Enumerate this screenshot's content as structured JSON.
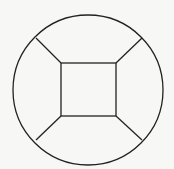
{
  "diagram": {
    "background": "#f7f7f5",
    "stroke": "#222222",
    "stroke_width": 1.3,
    "circle": {
      "cx": 88,
      "cy": 90,
      "r": 75
    },
    "square": {
      "x": 61,
      "y": 63,
      "w": 55,
      "h": 53
    },
    "connectors": [
      {
        "x1": 61,
        "y1": 63,
        "x2": 36,
        "y2": 38
      },
      {
        "x1": 116,
        "y1": 63,
        "x2": 142,
        "y2": 38
      },
      {
        "x1": 61,
        "y1": 116,
        "x2": 36,
        "y2": 140
      },
      {
        "x1": 116,
        "y1": 116,
        "x2": 142,
        "y2": 140
      }
    ]
  }
}
